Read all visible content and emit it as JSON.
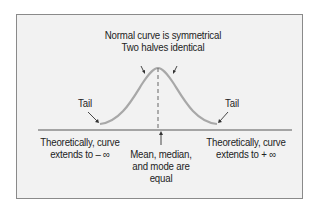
{
  "diagram": {
    "title_line1": "Normal curve is symmetrical",
    "title_line2": "Two halves identical",
    "tail_left": "Tail",
    "tail_right": "Tail",
    "left_line1": "Theoretically, curve",
    "left_line2": "extends to – ∞",
    "right_line1": "Theoretically, curve",
    "right_line2": "extends to + ∞",
    "center_line1": "Mean, median,",
    "center_line2": "and mode are",
    "center_line3": "equal",
    "colors": {
      "curve": "#a8a8a8",
      "axis": "#888888",
      "background": "#f2f2f2",
      "text": "#222222"
    }
  }
}
